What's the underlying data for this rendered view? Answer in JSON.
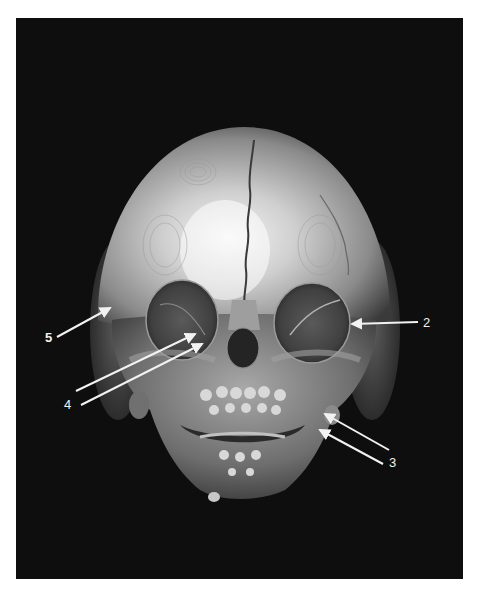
{
  "figure": {
    "type": "3D CT volume rendering, frontal view of infant skull",
    "background_color": "#0e0e0e",
    "page_background": "#ffffff",
    "annotations": [
      {
        "id": "label-5",
        "text": "5",
        "bold": true,
        "label_pos": [
          45,
          331
        ],
        "arrows": [
          {
            "from": [
              57,
              337
            ],
            "to": [
              110,
              308
            ]
          }
        ]
      },
      {
        "id": "label-2",
        "text": "2",
        "bold": false,
        "label_pos": [
          423,
          316
        ],
        "arrows": [
          {
            "from": [
              418,
              322
            ],
            "to": [
              352,
              324
            ]
          }
        ]
      },
      {
        "id": "label-4",
        "text": "4",
        "bold": false,
        "label_pos": [
          64,
          398
        ],
        "arrows": [
          {
            "from": [
              76,
              391
            ],
            "to": [
              195,
              334
            ]
          },
          {
            "from": [
              81,
              405
            ],
            "to": [
              202,
              344
            ]
          }
        ]
      },
      {
        "id": "label-3",
        "text": "3",
        "bold": false,
        "label_pos": [
          389,
          456
        ],
        "arrows": [
          {
            "from": [
              389,
              450
            ],
            "to": [
              325,
              414
            ]
          },
          {
            "from": [
              383,
              464
            ],
            "to": [
              320,
              430
            ]
          }
        ]
      }
    ],
    "arrow_color": "#f2f2f2"
  }
}
